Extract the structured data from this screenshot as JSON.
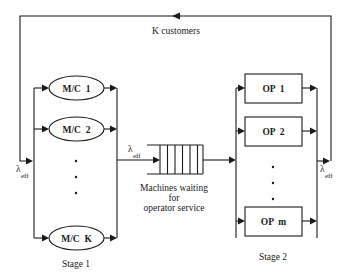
{
  "diagram": {
    "loop_label": "K customers",
    "stage1": {
      "caption": "Stage 1",
      "machines": [
        {
          "label": "M/C  1"
        },
        {
          "label": "M/C  2"
        },
        {
          "label": "M/C  K"
        }
      ],
      "ellipsis": "· · ·"
    },
    "queue": {
      "label_lines": [
        "Machines waiting",
        "for",
        "operator service"
      ],
      "slots": 6
    },
    "stage2": {
      "caption": "Stage 2",
      "operators": [
        {
          "label": "OP  1"
        },
        {
          "label": "OP  2"
        },
        {
          "label": "OP  m"
        }
      ]
    },
    "rate_symbol": "λ",
    "rate_subscript": "eff"
  },
  "colors": {
    "line": "#1a1a1a",
    "background": "#ffffff"
  }
}
